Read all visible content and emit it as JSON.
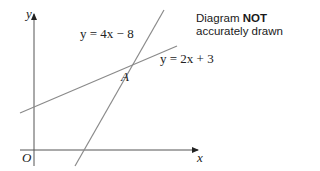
{
  "diagram": {
    "note": {
      "prefix": "Diagram ",
      "bold": "NOT",
      "line2": "accurately drawn"
    },
    "axes": {
      "x_label": "x",
      "y_label": "y",
      "origin_label": "O"
    },
    "lines": [
      {
        "label": "y = 4x − 8",
        "equation": "y = 4x - 8"
      },
      {
        "label": "y = 2x + 3",
        "equation": "y = 2x + 3"
      }
    ],
    "intersection_label": "A",
    "colors": {
      "axis": "#333333",
      "line": "#8a8a8a",
      "text": "#222222"
    }
  }
}
